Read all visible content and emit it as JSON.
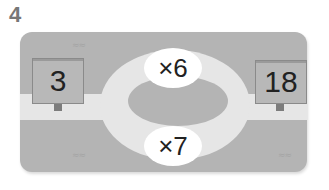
{
  "problem": {
    "number": "4"
  },
  "diagram": {
    "start_value": "3",
    "end_value": "18",
    "operations": [
      {
        "position": "top",
        "label": "×6"
      },
      {
        "position": "bottom",
        "label": "×7"
      }
    ],
    "decorations": {
      "grass_mark": "⁖⁖"
    }
  },
  "colors": {
    "board": "#b4b4b4",
    "road": "#e6e6e6",
    "bubble": "#ffffff",
    "sign": "#b8b8b8",
    "post": "#7c7c7c",
    "number_label": "#777777"
  }
}
